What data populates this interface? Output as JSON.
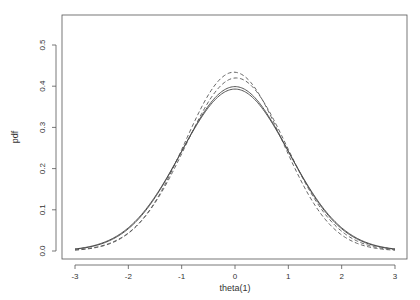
{
  "chart_data": {
    "type": "line",
    "title": "",
    "xlabel": "theta(1)",
    "ylabel": "pdf",
    "xlim": [
      -3.2,
      3.3
    ],
    "ylim": [
      -0.02,
      0.575
    ],
    "grid": false,
    "legend": null,
    "x_ticks": [
      "-3",
      "-2",
      "-1",
      "0",
      "1",
      "2",
      "3"
    ],
    "y_ticks": [
      "0.0",
      "0.1",
      "0.2",
      "0.3",
      "0.4",
      "0.5"
    ],
    "series": [
      {
        "name": "solid-1",
        "style": "solid",
        "mean": 0.0,
        "sd": 1.0,
        "peak": 0.399,
        "x_range": [
          -3,
          3
        ]
      },
      {
        "name": "solid-2",
        "style": "solid",
        "mean": 0.0,
        "sd": 1.015,
        "peak": 0.393,
        "x_range": [
          -3,
          3
        ]
      },
      {
        "name": "dashed-1",
        "style": "dashed",
        "mean": -0.02,
        "sd": 0.92,
        "peak": 0.434,
        "x_range": [
          -3,
          3
        ]
      },
      {
        "name": "dashed-2",
        "style": "dashed",
        "mean": 0.02,
        "sd": 0.95,
        "peak": 0.42,
        "x_range": [
          -3,
          3
        ]
      }
    ]
  }
}
